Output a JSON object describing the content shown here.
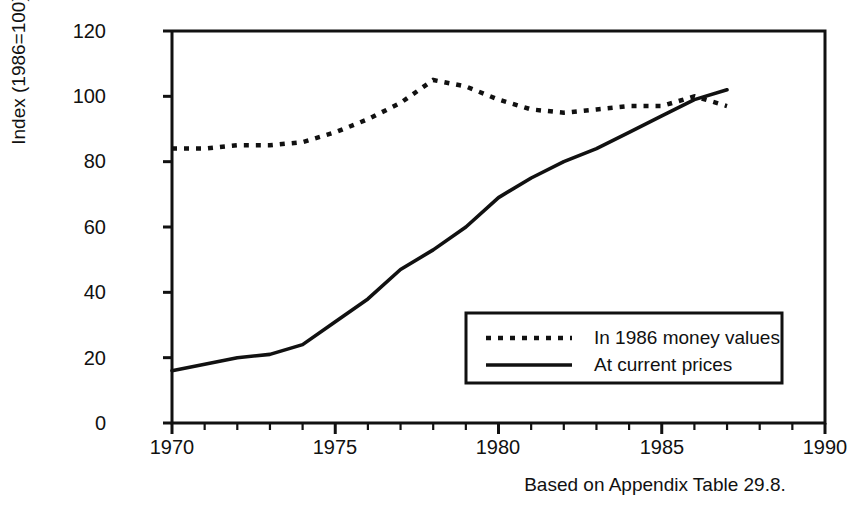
{
  "figure": {
    "title": "",
    "caption": "Based on Appendix Table 29.8.",
    "background": "#ffffff",
    "ink": "#111111"
  },
  "axes": {
    "y_axis_label": "Index (1986=100)",
    "y_ticks": [
      "0",
      "20",
      "40",
      "60",
      "80",
      "100",
      "120"
    ],
    "x_ticks": [
      "1970",
      "1975",
      "1980",
      "1985",
      "1990"
    ]
  },
  "legend": {
    "items": [
      {
        "label": "In 1986 money values",
        "style": "dotted"
      },
      {
        "label": "At current prices",
        "style": "solid"
      }
    ]
  },
  "chart_data": {
    "type": "line",
    "title": "",
    "xlabel": "",
    "ylabel": "Index (1986=100)",
    "xlim": [
      1970,
      1990
    ],
    "ylim": [
      0,
      120
    ],
    "xticks": [
      1970,
      1975,
      1980,
      1985,
      1990
    ],
    "yticks": [
      0,
      20,
      40,
      60,
      80,
      100,
      120
    ],
    "minor_xticks_every": 1,
    "grid": false,
    "legend_position": "lower right",
    "x": [
      1970,
      1971,
      1972,
      1973,
      1974,
      1975,
      1976,
      1977,
      1978,
      1979,
      1980,
      1981,
      1982,
      1983,
      1984,
      1985,
      1986,
      1987
    ],
    "series": [
      {
        "name": "In 1986 money values",
        "style": "dotted",
        "values": [
          84,
          84,
          85,
          85,
          86,
          89,
          93,
          98,
          105,
          103,
          99,
          96,
          95,
          96,
          97,
          97,
          100,
          97
        ]
      },
      {
        "name": "At current prices",
        "style": "solid",
        "values": [
          16,
          18,
          20,
          21,
          24,
          31,
          38,
          47,
          53,
          60,
          69,
          75,
          80,
          84,
          89,
          94,
          99,
          102
        ]
      }
    ],
    "annotations": [
      "Based on Appendix Table 29.8."
    ]
  }
}
